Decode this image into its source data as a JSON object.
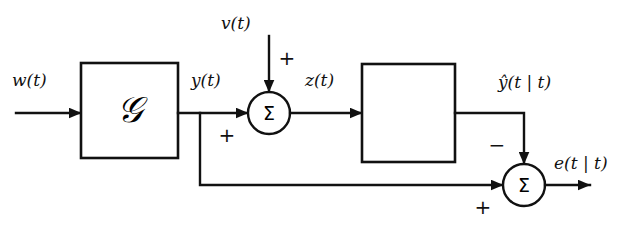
{
  "diagram": {
    "type": "block-diagram",
    "background_color": "#ffffff",
    "line_color": "#111111",
    "signals": {
      "input_w": "w(t)",
      "output_g": "y(t)",
      "noise_v": "v(t)",
      "sum_out_z": "z(t)",
      "estimate_yhat": "ŷ(t | t)",
      "error_e": "e(t | t)"
    },
    "blocks": [
      {
        "id": "block-g",
        "label": "𝒢",
        "plain": "G"
      },
      {
        "id": "block-h",
        "label": "𝒧",
        "plain": "H"
      }
    ],
    "summing_junctions": [
      {
        "id": "sum-1",
        "glyph": "Σ",
        "top_sign": "+",
        "left_sign": "+"
      },
      {
        "id": "sum-2",
        "glyph": "Σ",
        "top_sign": "−",
        "left_sign": "+"
      }
    ]
  }
}
